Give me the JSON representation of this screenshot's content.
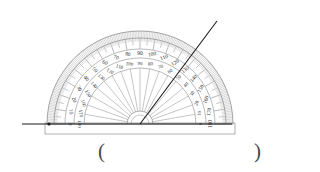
{
  "figure": {
    "kind": "protractor-angle-measurement",
    "center": {
      "x": 140,
      "y": 124
    },
    "outer_radius": 93,
    "baseline": {
      "x1": 22,
      "y1": 124,
      "x2": 232,
      "y2": 124
    },
    "ray": {
      "x1": 140,
      "y1": 124,
      "x2": 217,
      "y2": 21
    },
    "ray_angle_degrees": 53,
    "outer_scale_reading": 130,
    "inner_scale_reading": 50
  },
  "colors": {
    "ink": "#2b2b2b",
    "light_ink": "#8c8c8c",
    "hatch": "#a8a8a8",
    "paper": "#ffffff",
    "ray": "#1a1a1a"
  },
  "scale": {
    "outer_labels": [
      "0",
      "10",
      "20",
      "30",
      "40",
      "50",
      "60",
      "70",
      "80",
      "90",
      "100",
      "110",
      "120",
      "130",
      "140",
      "150",
      "160",
      "170",
      "180"
    ],
    "inner_labels": [
      "180",
      "170",
      "160",
      "150",
      "140",
      "130",
      "120",
      "110",
      "100",
      "90",
      "80",
      "70",
      "60",
      "50",
      "40",
      "30",
      "20",
      "10",
      "0"
    ],
    "major_step_degrees": 10,
    "minor_step_degrees": 1,
    "mid_step_degrees": 5
  },
  "answer": {
    "open_paren": "(",
    "close_paren": ")",
    "value": ""
  }
}
